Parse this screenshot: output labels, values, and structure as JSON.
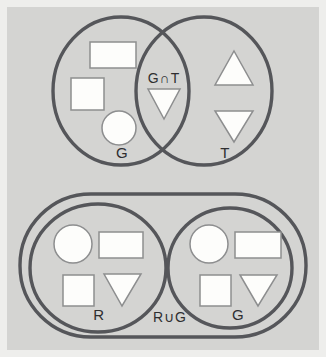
{
  "figure": {
    "background_color": "#d4d4d2",
    "outline_color": "#55565a",
    "shape_fill_color": "#fdfdfb",
    "shape_stroke_color": "#8d8e8f",
    "label_color": "#2e2e30",
    "frame_border_color": "#eeeeec"
  },
  "panels": {
    "top": {
      "name": "intersection-panel",
      "operation_label": "G∩T",
      "left_set": {
        "label": "G",
        "elements": [
          {
            "name": "rectangle",
            "icon": "rectangle-shape"
          },
          {
            "name": "square",
            "icon": "square-shape"
          },
          {
            "name": "circle",
            "icon": "circle-shape"
          }
        ]
      },
      "right_set": {
        "label": "T",
        "elements": [
          {
            "name": "triangle-up",
            "icon": "triangle-up-shape"
          },
          {
            "name": "triangle-down",
            "icon": "triangle-down-shape"
          }
        ]
      },
      "overlap_elements": [
        {
          "name": "triangle-down",
          "icon": "triangle-down-shape"
        }
      ]
    },
    "bottom": {
      "name": "union-panel",
      "operation_label": "R∪G",
      "left_set": {
        "label": "R",
        "elements": [
          {
            "name": "circle",
            "icon": "circle-shape"
          },
          {
            "name": "rectangle",
            "icon": "rectangle-shape"
          },
          {
            "name": "square",
            "icon": "square-shape"
          },
          {
            "name": "triangle-down",
            "icon": "triangle-down-shape"
          }
        ]
      },
      "right_set": {
        "label": "G",
        "elements": [
          {
            "name": "circle",
            "icon": "circle-shape"
          },
          {
            "name": "rectangle",
            "icon": "rectangle-shape"
          },
          {
            "name": "square",
            "icon": "square-shape"
          },
          {
            "name": "triangle-down",
            "icon": "triangle-down-shape"
          }
        ]
      }
    }
  }
}
